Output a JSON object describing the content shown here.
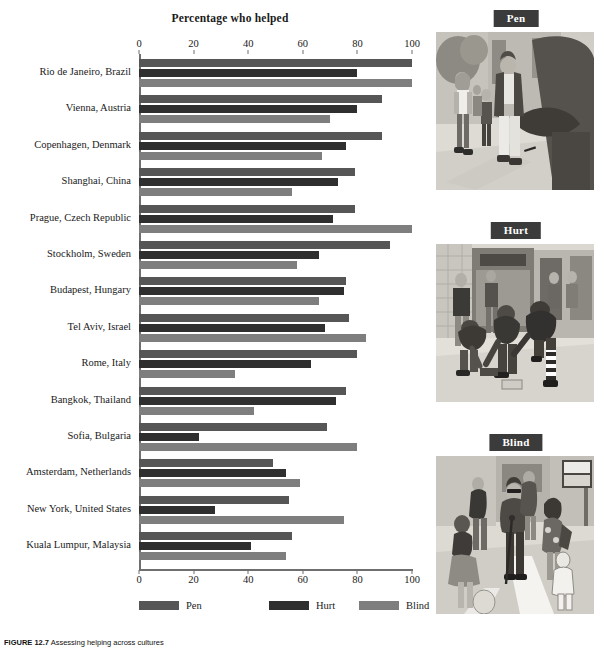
{
  "figure": {
    "caption_prefix": "FIGURE 12.7",
    "caption_text": "Assessing helping across cultures",
    "caption_full": "FIGURE 12.7  Assessing helping across cultures"
  },
  "chart_data": {
    "type": "bar",
    "orientation": "horizontal",
    "title": "Percentage who helped",
    "xlabel": "",
    "ylabel": "",
    "xlim": [
      0,
      100
    ],
    "xticks": [
      0,
      20,
      40,
      60,
      80,
      100
    ],
    "xtick_labels": [
      "0",
      "20",
      "40",
      "60",
      "80",
      "100"
    ],
    "axis_top": true,
    "axis_bottom": true,
    "grid": false,
    "legend_position": "bottom",
    "categories": [
      "Rio de Janeiro, Brazil",
      "Vienna, Austria",
      "Copenhagen, Denmark",
      "Shanghai, China",
      "Prague, Czech Republic",
      "Stockholm, Sweden",
      "Budapest, Hungary",
      "Tel Aviv, Israel",
      "Rome, Italy",
      "Bangkok, Thailand",
      "Sofia, Bulgaria",
      "Amsterdam, Netherlands",
      "New York, United States",
      "Kuala Lumpur, Malaysia"
    ],
    "series": [
      {
        "name": "Pen",
        "color": "#565656",
        "values": [
          100,
          89,
          89,
          79,
          79,
          92,
          76,
          77,
          80,
          76,
          69,
          49,
          55,
          56
        ]
      },
      {
        "name": "Hurt",
        "color": "#2f2f2f",
        "values": [
          80,
          80,
          76,
          73,
          71,
          66,
          75,
          68,
          63,
          72,
          22,
          54,
          28,
          41
        ]
      },
      {
        "name": "Blind",
        "color": "#7e7e7e",
        "values": [
          100,
          70,
          67,
          56,
          100,
          58,
          66,
          83,
          35,
          42,
          80,
          59,
          75,
          54
        ]
      }
    ]
  },
  "panels": [
    {
      "tag": "Pen",
      "art": "pen-illustration"
    },
    {
      "tag": "Hurt",
      "art": "hurt-illustration"
    },
    {
      "tag": "Blind",
      "art": "blind-illustration"
    }
  ],
  "colors": {
    "pen": "#565656",
    "hurt": "#2f2f2f",
    "blind": "#7e7e7e",
    "axis": "#6f6f6f",
    "tag_bg": "#3b3b3b",
    "tag_text": "#ffffff"
  }
}
